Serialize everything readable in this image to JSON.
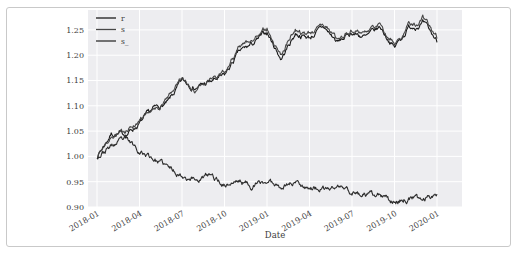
{
  "figure": {
    "xlabel": "Date",
    "legend_labels": [
      "r",
      "s",
      "s_"
    ]
  },
  "chart_data": {
    "type": "line",
    "title": "",
    "xlabel": "Date",
    "ylabel": "",
    "grid": true,
    "legend_position": "upper left",
    "plot_bg": "#ededf0",
    "grid_color": "#ffffff",
    "tick_color": "#3c3c3c",
    "x_tick_labels": [
      "2018-01",
      "2018-04",
      "2018-07",
      "2018-10",
      "2019-01",
      "2019-04",
      "2019-07",
      "2019-10",
      "2020-01"
    ],
    "y_ticks": [
      0.9,
      0.95,
      1.0,
      1.05,
      1.1,
      1.15,
      1.2,
      1.25
    ],
    "ylim": [
      0.885,
      1.29
    ],
    "x_unit": "months since 2018-01",
    "x_months": [
      0,
      1,
      2,
      3,
      4,
      5,
      6,
      7,
      8,
      9,
      10,
      11,
      12,
      13,
      14,
      15,
      16,
      17,
      18,
      19,
      20,
      21,
      22,
      23,
      24
    ],
    "series": [
      {
        "name": "r",
        "color": "#1b1b1b",
        "values": [
          1.0,
          1.045,
          1.043,
          1.065,
          1.093,
          1.105,
          1.148,
          1.137,
          1.147,
          1.158,
          1.205,
          1.222,
          1.245,
          1.193,
          1.243,
          1.235,
          1.255,
          1.225,
          1.245,
          1.235,
          1.255,
          1.215,
          1.255,
          1.263,
          1.228
        ]
      },
      {
        "name": "s",
        "color": "#474747",
        "values": [
          1.0,
          1.04,
          1.05,
          1.071,
          1.088,
          1.112,
          1.153,
          1.131,
          1.153,
          1.164,
          1.212,
          1.23,
          1.252,
          1.201,
          1.251,
          1.242,
          1.262,
          1.232,
          1.252,
          1.242,
          1.262,
          1.222,
          1.262,
          1.271,
          1.235
        ]
      },
      {
        "name": "s_",
        "color": "#2d2d2d",
        "values": [
          1.0,
          1.02,
          1.033,
          1.012,
          0.996,
          0.978,
          0.963,
          0.955,
          0.962,
          0.944,
          0.952,
          0.942,
          0.95,
          0.943,
          0.95,
          0.94,
          0.933,
          0.94,
          0.93,
          0.922,
          0.92,
          0.91,
          0.918,
          0.914,
          0.93
        ]
      }
    ]
  }
}
